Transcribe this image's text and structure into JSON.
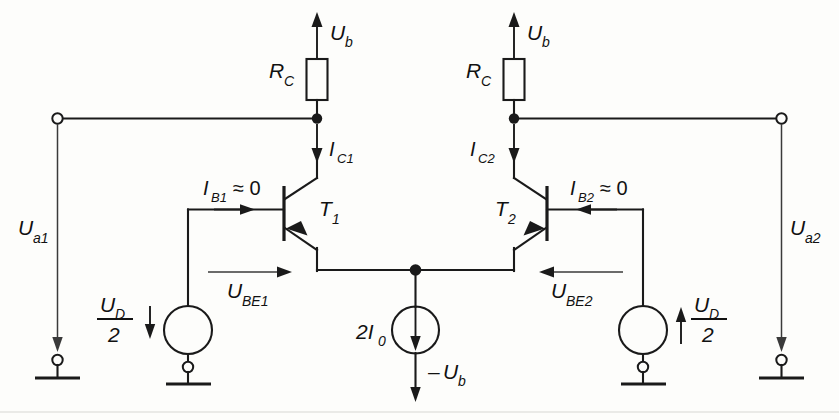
{
  "diagram": {
    "supply_top_left": "U",
    "supply_top_left_sub": "b",
    "supply_top_right": "U",
    "supply_top_right_sub": "b",
    "resistor_left": "R",
    "resistor_left_sub": "C",
    "resistor_right": "R",
    "resistor_right_sub": "C",
    "collector_current_left": "I",
    "collector_current_left_sub": "C1",
    "collector_current_right": "I",
    "collector_current_right_sub": "C2",
    "base_current_left": "I",
    "base_current_left_sub": "B1",
    "base_current_left_rel": "≈ 0",
    "base_current_right": "I",
    "base_current_right_sub": "B2",
    "base_current_right_rel": "≈ 0",
    "transistor_left": "T",
    "transistor_left_sub": "1",
    "transistor_right": "T",
    "transistor_right_sub": "2",
    "vbe_left": "U",
    "vbe_left_sub": "BE1",
    "vbe_right": "U",
    "vbe_right_sub": "BE2",
    "output_left": "U",
    "output_left_sub": "a1",
    "output_right": "U",
    "output_right_sub": "a2",
    "source_left_num": "U",
    "source_left_num_sub": "D",
    "source_left_den": "2",
    "source_right_num": "U",
    "source_right_num_sub": "D",
    "source_right_den": "2",
    "tail_current": "2I",
    "tail_current_sub": "0",
    "negative_supply_sign": "–",
    "negative_supply": "U",
    "negative_supply_sub": "b",
    "icons": {
      "resistor": "resistor-symbol",
      "transistor": "bipolar-transistor-symbol",
      "voltage_source": "voltage-source-circle",
      "current_source": "current-source-circle",
      "ground": "ground-symbol",
      "terminal": "open-terminal-circle",
      "junction": "wire-junction-dot"
    },
    "colors": {
      "wire": "#1a1a1a",
      "background": "#fdfdfb",
      "label": "#111111"
    }
  }
}
